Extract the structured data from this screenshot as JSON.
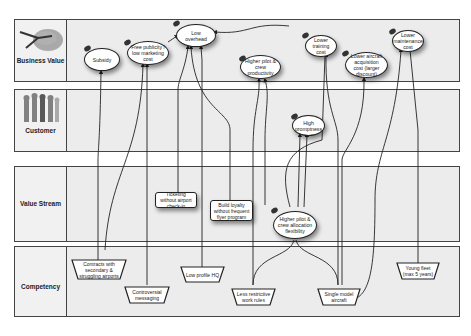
{
  "lanes": [
    {
      "id": "business-value",
      "label": "Business Value",
      "icon": "airplane-icon"
    },
    {
      "id": "customer",
      "label": "Customer",
      "icon": "people-icon"
    },
    {
      "id": "value-stream",
      "label": "Value Stream",
      "icon": ""
    },
    {
      "id": "competency",
      "label": "Competency",
      "icon": ""
    }
  ],
  "business_value": {
    "subsidy": "Subsidy",
    "free_publicity": "Free publicity / low marketing cost",
    "low_overhead": "Low overhead",
    "higher_productivity": "Higher pilot & crew productivity",
    "lower_training": "Lower training cost",
    "lower_acquisition": "Lower aircraft acquisition cost (larger discount)",
    "lower_maintenance": "Lower maintenance cost"
  },
  "customer": {
    "high_promptness": "High promptness"
  },
  "value_stream": {
    "ticketing": "Ticketing without airport check-in",
    "loyalty": "Build loyalty without frequent flyer program",
    "crew_flex": "Higher pilot & crew allocation flexibility"
  },
  "competency": {
    "contracts": "Contracts with secondary & struggling airports",
    "controversial": "Controversial messaging",
    "low_profile": "Low profile HQ",
    "work_rules": "Less restrictive work rules",
    "single_model": "Single model aircraft",
    "young_fleet": "Young fleet (max 5 years)"
  }
}
